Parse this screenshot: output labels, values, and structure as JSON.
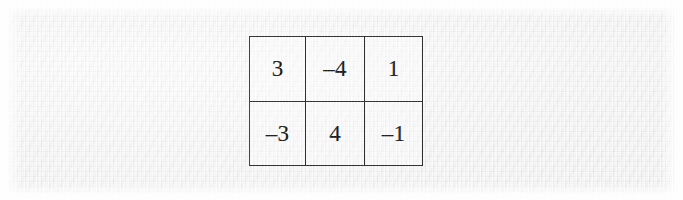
{
  "document": {
    "kind": "scanned-page-excerpt",
    "background_color": "#efefef",
    "margin_color": "#ffffff",
    "ink_color": "#1c1c1c",
    "grid_line_color": "#2f2f2f"
  },
  "matrix": {
    "rows": 2,
    "columns": 3,
    "cells": [
      [
        "3",
        "–4",
        "1"
      ],
      [
        "–3",
        "4",
        "–1"
      ]
    ],
    "numeric_values": [
      [
        3,
        -4,
        1
      ],
      [
        -3,
        4,
        -1
      ]
    ],
    "row_0": {
      "c0": "3",
      "c1": "–4",
      "c2": "1"
    },
    "row_1": {
      "c0": "–3",
      "c1": "4",
      "c2": "–1"
    }
  }
}
